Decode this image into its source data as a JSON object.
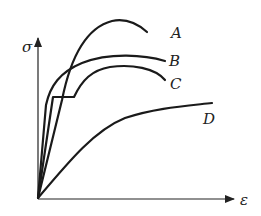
{
  "diagram": {
    "axes": {
      "y_label": "σ",
      "x_label": "ε"
    },
    "curves": [
      {
        "id": "A",
        "label": "A"
      },
      {
        "id": "B",
        "label": "B"
      },
      {
        "id": "C",
        "label": "C"
      },
      {
        "id": "D",
        "label": "D"
      }
    ],
    "colors": {
      "line": "#1a1a1a",
      "background": "#ffffff"
    }
  }
}
